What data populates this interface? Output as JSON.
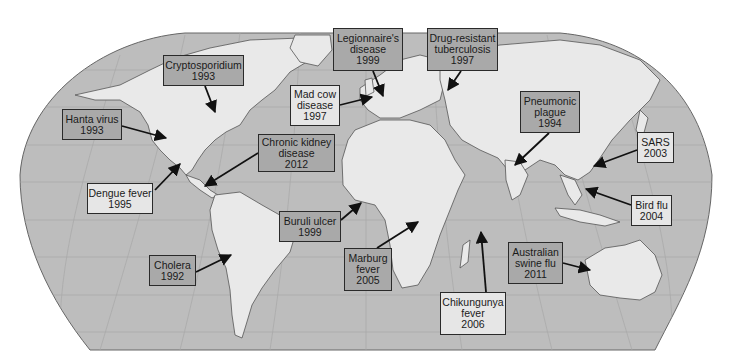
{
  "colors": {
    "ocean": "#bdbdbd",
    "land": "#e9e9e9",
    "border": "#555555",
    "graticule": "#a8a8a8",
    "box_dark": "#a9a9a9",
    "box_light": "#e6e6e6",
    "arrow": "#111111"
  },
  "map": {
    "projection": "Robinson-like world map",
    "labels": [
      {
        "id": "cryptosporidium",
        "lines": [
          "Cryptosporidium",
          "1993"
        ],
        "style": "dark",
        "box": [
          163,
          55,
          81,
          31
        ],
        "arrow": [
          [
            205,
            86
          ],
          [
            215,
            112
          ]
        ]
      },
      {
        "id": "hanta-virus",
        "lines": [
          "Hanta virus",
          "1993"
        ],
        "style": "dark",
        "box": [
          62,
          109,
          60,
          31
        ],
        "arrow": [
          [
            122,
            126
          ],
          [
            166,
            138
          ]
        ]
      },
      {
        "id": "legionnaires-disease",
        "lines": [
          "Legionnaire's",
          "disease",
          "1999"
        ],
        "style": "dark",
        "box": [
          333,
          28,
          70,
          43
        ],
        "arrow": [
          [
            373,
            71
          ],
          [
            383,
            96
          ]
        ]
      },
      {
        "id": "drug-resistant-tuberculosis",
        "lines": [
          "Drug-resistant",
          "tuberculosis",
          "1997"
        ],
        "style": "dark",
        "box": [
          427,
          28,
          71,
          43
        ],
        "arrow": [
          [
            461,
            71
          ],
          [
            448,
            90
          ]
        ]
      },
      {
        "id": "mad-cow-disease",
        "lines": [
          "Mad cow",
          "disease",
          "1997"
        ],
        "style": "light",
        "box": [
          290,
          85,
          50,
          41
        ],
        "arrow": [
          [
            340,
            105
          ],
          [
            372,
            97
          ]
        ]
      },
      {
        "id": "chronic-kidney-disease",
        "lines": [
          "Chronic kidney",
          "disease",
          "2012"
        ],
        "style": "dark",
        "box": [
          258,
          134,
          77,
          38
        ],
        "arrow": [
          [
            258,
            153
          ],
          [
            205,
            186
          ]
        ]
      },
      {
        "id": "dengue-fever",
        "lines": [
          "Dengue fever",
          "1995"
        ],
        "style": "light",
        "box": [
          87,
          183,
          66,
          31
        ],
        "arrow": [
          [
            155,
            190
          ],
          [
            180,
            164
          ]
        ]
      },
      {
        "id": "pneumonic-plague",
        "lines": [
          "Pneumonic",
          "plague",
          "1994"
        ],
        "style": "dark",
        "box": [
          520,
          91,
          60,
          42
        ],
        "arrow": [
          [
            549,
            133
          ],
          [
            515,
            165
          ]
        ]
      },
      {
        "id": "sars",
        "lines": [
          "SARS",
          "2003"
        ],
        "style": "light",
        "box": [
          637,
          132,
          37,
          31
        ],
        "arrow": [
          [
            637,
            150
          ],
          [
            594,
            166
          ]
        ]
      },
      {
        "id": "bird-flu",
        "lines": [
          "Bird flu",
          "2004"
        ],
        "style": "light",
        "box": [
          631,
          195,
          41,
          31
        ],
        "arrow": [
          [
            631,
            205
          ],
          [
            586,
            189
          ]
        ]
      },
      {
        "id": "buruli-ulcer",
        "lines": [
          "Buruli ulcer",
          "1999"
        ],
        "style": "dark",
        "box": [
          279,
          211,
          62,
          31
        ],
        "arrow": [
          [
            341,
            220
          ],
          [
            361,
            203
          ]
        ]
      },
      {
        "id": "cholera",
        "lines": [
          "Cholera",
          "1992"
        ],
        "style": "dark",
        "box": [
          149,
          255,
          47,
          31
        ],
        "arrow": [
          [
            196,
            272
          ],
          [
            231,
            255
          ]
        ]
      },
      {
        "id": "marburg-fever",
        "lines": [
          "Marburg",
          "fever",
          "2005"
        ],
        "style": "dark",
        "box": [
          344,
          248,
          48,
          43
        ],
        "arrow": [
          [
            377,
            248
          ],
          [
            418,
            222
          ]
        ]
      },
      {
        "id": "australian-swine-flu",
        "lines": [
          "Australian",
          "swine flu",
          "2011"
        ],
        "style": "dark",
        "box": [
          508,
          242,
          55,
          42
        ],
        "arrow": [
          [
            563,
            263
          ],
          [
            590,
            270
          ]
        ]
      },
      {
        "id": "chikungunya-fever",
        "lines": [
          "Chikungunya",
          "fever",
          "2006"
        ],
        "style": "light",
        "box": [
          440,
          292,
          66,
          43
        ],
        "arrow": [
          [
            486,
            292
          ],
          [
            481,
            232
          ]
        ]
      }
    ]
  }
}
